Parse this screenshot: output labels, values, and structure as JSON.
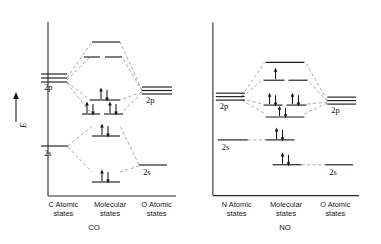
{
  "figure": {
    "axis_label": "E",
    "axis_arrow": "up-arrow"
  },
  "panels": [
    {
      "id": "co",
      "molecule": "CO",
      "columns": [
        {
          "line1": "C Atomic",
          "line2": "states"
        },
        {
          "line1": "Molecular",
          "line2": "states"
        },
        {
          "line1": "O Atomic",
          "line2": "states"
        }
      ],
      "orbital_labels": {
        "left_2p": "2p",
        "left_2s": "2s",
        "right_2p": "2p",
        "right_2s": "2s"
      },
      "levels": {
        "left_atomic": [
          {
            "name": "C 2p",
            "degeneracy": 3,
            "electrons": 0
          },
          {
            "name": "C 2s",
            "degeneracy": 1,
            "electrons": 0
          }
        ],
        "right_atomic": [
          {
            "name": "O 2p",
            "degeneracy": 3,
            "electrons": 0
          },
          {
            "name": "O 2s",
            "degeneracy": 1,
            "electrons": 0
          }
        ],
        "molecular": [
          {
            "name": "sigma-star-2p",
            "split": 1,
            "electrons": 0
          },
          {
            "name": "pi-star-2p",
            "split": 2,
            "electrons": 0
          },
          {
            "name": "sigma-2p",
            "split": 1,
            "electrons": 2
          },
          {
            "name": "pi-2p",
            "split": 2,
            "electrons": 4
          },
          {
            "name": "sigma-star-2s",
            "split": 1,
            "electrons": 2
          },
          {
            "name": "sigma-2s",
            "split": 1,
            "electrons": 2
          }
        ]
      },
      "total_electrons_shown": 10
    },
    {
      "id": "no",
      "molecule": "NO",
      "columns": [
        {
          "line1": "N Atomic",
          "line2": "states"
        },
        {
          "line1": "Molecular",
          "line2": "states"
        },
        {
          "line1": "O Atomic",
          "line2": "states"
        }
      ],
      "orbital_labels": {
        "left_2p": "2p",
        "left_2s": "2s",
        "right_2p": "2p",
        "right_2s": "2s"
      },
      "levels": {
        "left_atomic": [
          {
            "name": "N 2p",
            "degeneracy": 3,
            "electrons": 0
          },
          {
            "name": "N 2s",
            "degeneracy": 1,
            "electrons": 0
          }
        ],
        "right_atomic": [
          {
            "name": "O 2p",
            "degeneracy": 3,
            "electrons": 0
          },
          {
            "name": "O 2s",
            "degeneracy": 1,
            "electrons": 0
          }
        ],
        "molecular": [
          {
            "name": "sigma-star-2p",
            "split": 1,
            "electrons": 0
          },
          {
            "name": "pi-star-2p",
            "split": 2,
            "electrons": 1
          },
          {
            "name": "pi-2p",
            "split": 2,
            "electrons": 4
          },
          {
            "name": "sigma-2p",
            "split": 1,
            "electrons": 2
          },
          {
            "name": "sigma-star-2s",
            "split": 1,
            "electrons": 2
          },
          {
            "name": "sigma-2s",
            "split": 1,
            "electrons": 2
          }
        ]
      },
      "total_electrons_shown": 11
    }
  ]
}
